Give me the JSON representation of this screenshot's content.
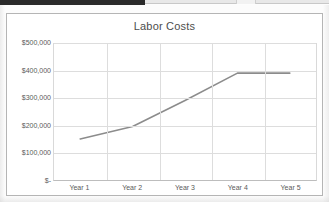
{
  "chart_data": {
    "type": "line",
    "title": "Labor Costs",
    "xlabel": "",
    "ylabel": "",
    "categories": [
      "Year 1",
      "Year 2",
      "Year 3",
      "Year 4",
      "Year 5"
    ],
    "series": [
      {
        "name": "Labor Costs",
        "values": [
          150000,
          195000,
          290000,
          390000,
          390000
        ],
        "color": "#8c8c8c"
      }
    ],
    "ylim": [
      0,
      500000
    ],
    "ytick_values": [
      500000,
      400000,
      300000,
      200000,
      100000,
      0
    ],
    "ytick_labels": [
      "$500,000",
      "$400,000",
      "$300,000",
      "$200,000",
      "$100,000",
      "$-"
    ],
    "grid": {
      "horizontal": true,
      "vertical": true,
      "color": "#dddddd"
    },
    "legend": {
      "visible": false,
      "position": "none"
    },
    "plot_background": "#ffffff",
    "chart_background": "#ffffff",
    "border_color": "#b5b5b5"
  },
  "colors": {
    "line": "#8c8c8c",
    "grid": "#dddddd",
    "axis_text": "#5a5a5a",
    "title_text": "#4d4d4d",
    "frame_border": "#b5b5b5"
  }
}
